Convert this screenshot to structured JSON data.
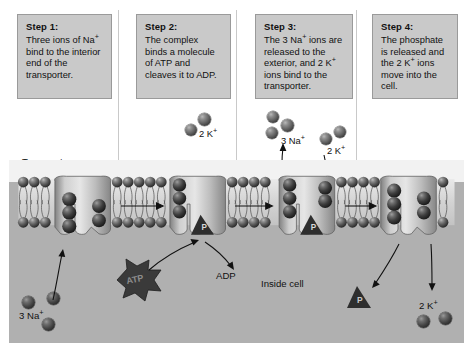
{
  "diagram": {
    "steps": [
      {
        "heading": "Step 1:",
        "body_html": "Three ions of Na<sup>+</sup> bind to the interior end of the transporter.",
        "body_text": "Three ions of Na+ bind to the interior end of the transporter."
      },
      {
        "heading": "Step 2:",
        "body_html": "The complex binds a molecule of ATP and cleaves it to ADP.",
        "body_text": "The complex binds a molecule of ATP and cleaves it to ADP."
      },
      {
        "heading": "Step 3:",
        "body_html": "The 3 Na<sup>+</sup> ions are released to the exterior, and 2 K<sup>+</sup> ions bind to the transporter.",
        "body_text": "The 3 Na+ ions are released to the exterior, and 2 K+ ions bind to the transporter."
      },
      {
        "heading": "Step 4:",
        "body_html": "The phosphate is released and the 2 K<sup>+</sup> ions move into the cell.",
        "body_text": "The phosphate is released and the 2 K+ ions move into the cell."
      }
    ],
    "labels": {
      "transporter": "Transporter",
      "inside_cell": "Inside cell",
      "adp": "ADP",
      "atp": "ATP",
      "phosphate": "P",
      "na_bottom_left_html": "3 Na<sup>+</sup>",
      "na_bottom_left_text": "3 Na+",
      "k_step2_html": "2 K<sup>+</sup>",
      "k_step2_text": "2 K+",
      "na_step3_html": "3 Na<sup>+</sup>",
      "na_step3_text": "3 Na+",
      "k_step3_html": "2 K<sup>+</sup>",
      "k_step3_text": "2 K+",
      "k_step4_html": "2 K<sup>+</sup>",
      "k_step4_text": "2 K+",
      "k_top_html": "2 K<sup>+</sup>",
      "k_top_text": "2 K+"
    },
    "colors": {
      "page_background": "#ffffff",
      "step_box_fill": "#c9c9c9",
      "step_box_border": "#9a9a9a",
      "cytoplasm": "#b0b0b0",
      "extracellular": "#f2f2f2",
      "ion_dark": "#3a3a3a",
      "text": "#111111"
    },
    "ion_counts": {
      "step1_sodium_inside": 3,
      "step2_potassium_outside": 2,
      "step3_sodium_released": 3,
      "step3_potassium_binding": 2,
      "step4_potassium_inside": 2
    }
  }
}
